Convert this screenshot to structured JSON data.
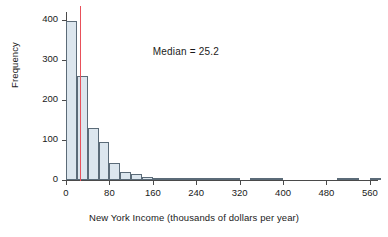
{
  "chart_data": {
    "type": "bar",
    "title": "",
    "xlabel": "New York Income (thousands of dollars per year)",
    "ylabel": "Frequency",
    "xlim": [
      0,
      575
    ],
    "ylim": [
      0,
      420
    ],
    "xticks": [
      0,
      80,
      160,
      240,
      320,
      400,
      480,
      560
    ],
    "yticks": [
      0,
      100,
      200,
      300,
      400
    ],
    "grid": false,
    "legend": null,
    "bin_width": 20,
    "bin_starts": [
      0,
      20,
      40,
      60,
      80,
      100,
      120,
      140,
      160,
      180,
      200,
      220,
      240,
      260,
      280,
      300,
      320,
      340,
      360,
      380,
      400,
      420,
      440,
      460,
      480,
      500,
      520,
      540,
      560
    ],
    "values": [
      397,
      260,
      130,
      95,
      43,
      19,
      14,
      7,
      3,
      1,
      2,
      3,
      2,
      3,
      1,
      1,
      0,
      4,
      3,
      1,
      0,
      0,
      0,
      0,
      0,
      2,
      1,
      0,
      1
    ],
    "annotations": [
      {
        "name": "median-annotation",
        "text": "Median = 25.2",
        "x": 160,
        "y": 320
      },
      {
        "name": "median-line",
        "type": "vline",
        "x": 25.2,
        "color": "#e8505a"
      }
    ],
    "colors": {
      "bar_fill": "#dce6ee",
      "bar_edge": "#5b6b78",
      "axis": "#4a4a4a",
      "median": "#e8505a",
      "background": "#ffffff",
      "text": "#1a1a1a"
    }
  },
  "axis": {
    "y_labels": [
      "400",
      "300",
      "200",
      "100",
      "0"
    ],
    "x_labels": [
      "0",
      "80",
      "160",
      "240",
      "320",
      "400",
      "480",
      "560"
    ],
    "y_title": "Frequency",
    "x_title": "New York Income (thousands of dollars per year)"
  },
  "annotation": {
    "median_text": "Median = 25.2"
  }
}
